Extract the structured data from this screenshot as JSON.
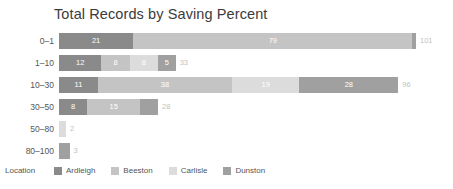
{
  "chart_data": {
    "type": "bar",
    "orientation": "horizontal",
    "stacked": true,
    "title": "Total Records by Saving Percent",
    "xlabel": "",
    "ylabel": "",
    "categories": [
      "0–1",
      "1–10",
      "10–30",
      "30–50",
      "50–80",
      "80–100"
    ],
    "legend_title": "Location",
    "legend_position": "bottom",
    "grid": false,
    "axis_visible": false,
    "xlim": [
      0,
      101
    ],
    "series": [
      {
        "name": "Ardleigh",
        "color": "#8a8a8a",
        "values": [
          21,
          12,
          11,
          8,
          0,
          0
        ]
      },
      {
        "name": "Beeston",
        "color": "#c4c4c4",
        "values": [
          79,
          8,
          38,
          15,
          0,
          0
        ]
      },
      {
        "name": "Carlisle",
        "color": "#dcdcdc",
        "values": [
          0,
          8,
          19,
          0,
          2,
          0
        ]
      },
      {
        "name": "Dunston",
        "color": "#a0a0a0",
        "values": [
          1,
          5,
          28,
          5,
          0,
          3
        ]
      }
    ],
    "row_totals": [
      101,
      33,
      96,
      28,
      2,
      3
    ],
    "bar_segment_labels": [
      [
        "21",
        "79",
        "",
        ""
      ],
      [
        "12",
        "8",
        "8",
        "5"
      ],
      [
        "11",
        "38",
        "19",
        "28"
      ],
      [
        "8",
        "15",
        "",
        ""
      ],
      [
        "",
        "",
        "",
        ""
      ],
      [
        "",
        "",
        "",
        ""
      ]
    ],
    "total_labels": [
      "101",
      "33",
      "96",
      "28",
      "2",
      "3"
    ]
  },
  "colors": {
    "background": "#ffffff",
    "title_text": "#3b3b3b",
    "axis_text": "#555555",
    "total_text": "#c2c2c2",
    "segment_text": "#ffffff"
  }
}
